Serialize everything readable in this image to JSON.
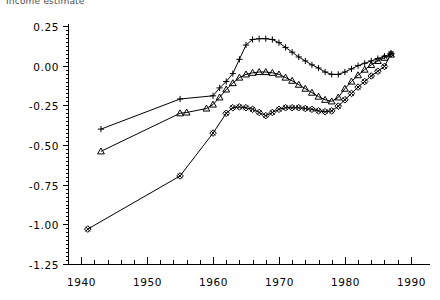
{
  "chart_data": {
    "type": "line",
    "title": "Income estimate",
    "xlabel": "",
    "ylabel": "",
    "xlim": [
      1938,
      1992
    ],
    "ylim": [
      -1.25,
      0.25
    ],
    "xticks": [
      1940,
      1950,
      1960,
      1970,
      1980,
      1990
    ],
    "xtick_labels": [
      "1940",
      "1950",
      "1960",
      "1970",
      "1980",
      "1990"
    ],
    "yticks": [
      0.25,
      0.0,
      -0.25,
      -0.5,
      -0.75,
      -1.0,
      -1.25
    ],
    "ytick_labels": [
      "0.25",
      "0.00",
      "-0.25",
      "-0.50",
      "-0.75",
      "-1.00",
      "-1.25"
    ],
    "x_minor_tick_interval": 2,
    "grid": false,
    "legend": "none",
    "background_color": "#ffffff",
    "line_color": "#000000",
    "series": [
      {
        "name": "series-plus",
        "marker": "plus",
        "x": [
          1943,
          1955,
          1960,
          1961,
          1962,
          1963,
          1964,
          1965,
          1966,
          1967,
          1968,
          1969,
          1970,
          1971,
          1972,
          1973,
          1974,
          1975,
          1976,
          1977,
          1978,
          1979,
          1980,
          1981,
          1982,
          1983,
          1984,
          1985,
          1986,
          1987
        ],
        "values": [
          -0.4,
          -0.21,
          -0.19,
          -0.14,
          -0.1,
          -0.05,
          0.04,
          0.13,
          0.165,
          0.17,
          0.17,
          0.165,
          0.145,
          0.115,
          0.085,
          0.055,
          0.03,
          0.005,
          -0.015,
          -0.04,
          -0.055,
          -0.055,
          -0.04,
          -0.02,
          0.0,
          0.015,
          0.03,
          0.045,
          0.06,
          0.075
        ]
      },
      {
        "name": "series-triangle",
        "marker": "triangle",
        "x": [
          1943,
          1955,
          1956,
          1959,
          1960,
          1961,
          1962,
          1963,
          1964,
          1965,
          1966,
          1967,
          1968,
          1969,
          1970,
          1971,
          1972,
          1973,
          1974,
          1975,
          1976,
          1977,
          1978,
          1979,
          1980,
          1981,
          1982,
          1983,
          1984,
          1985,
          1986,
          1987
        ],
        "values": [
          -0.54,
          -0.3,
          -0.295,
          -0.27,
          -0.245,
          -0.2,
          -0.15,
          -0.11,
          -0.075,
          -0.055,
          -0.045,
          -0.04,
          -0.04,
          -0.045,
          -0.055,
          -0.075,
          -0.095,
          -0.12,
          -0.145,
          -0.17,
          -0.195,
          -0.215,
          -0.225,
          -0.2,
          -0.145,
          -0.1,
          -0.06,
          -0.025,
          0.005,
          0.03,
          0.05,
          0.07
        ]
      },
      {
        "name": "series-diamond",
        "marker": "diamond",
        "x": [
          1941,
          1955,
          1960,
          1962,
          1963,
          1964,
          1965,
          1966,
          1967,
          1968,
          1969,
          1970,
          1971,
          1972,
          1973,
          1974,
          1975,
          1976,
          1977,
          1978,
          1979,
          1980,
          1981,
          1982,
          1983,
          1984,
          1985,
          1986,
          1987
        ],
        "values": [
          -1.03,
          -0.695,
          -0.425,
          -0.3,
          -0.265,
          -0.26,
          -0.265,
          -0.275,
          -0.295,
          -0.315,
          -0.295,
          -0.275,
          -0.265,
          -0.265,
          -0.265,
          -0.27,
          -0.275,
          -0.285,
          -0.29,
          -0.285,
          -0.255,
          -0.215,
          -0.175,
          -0.135,
          -0.1,
          -0.065,
          -0.035,
          -0.005,
          0.075
        ]
      }
    ]
  },
  "layout": {
    "plot_left": 68,
    "plot_right": 424,
    "plot_top": 26,
    "plot_bottom": 264
  }
}
